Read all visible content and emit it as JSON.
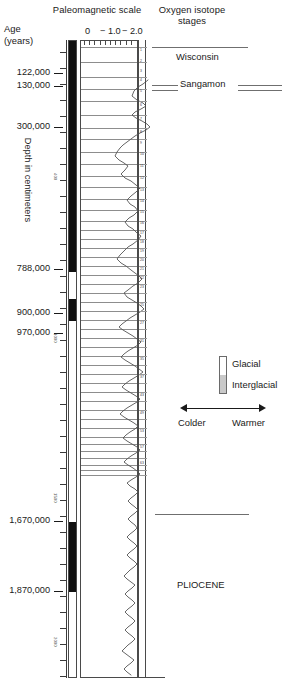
{
  "figure": {
    "type": "stratigraphic-column",
    "paleomagnetic_title": "Paleomagnetic scale",
    "oxygen_title": "Oxygen isotope stages",
    "age_axis_label_line1": "Age",
    "age_axis_label_line2": "(years)",
    "depth_axis_label": "Depth in centimeters"
  },
  "scale": {
    "ticks": [
      "0",
      "− 1.0",
      "− 2.0"
    ],
    "tick_x": [
      8,
      28,
      48
    ],
    "tick_label_x": [
      5,
      20,
      42
    ]
  },
  "age_labels": [
    {
      "text": "122,000",
      "y": 73
    },
    {
      "text": "130,000",
      "y": 86
    },
    {
      "text": "300,000",
      "y": 127
    },
    {
      "text": "788,000",
      "y": 269
    },
    {
      "text": "900,000",
      "y": 313
    },
    {
      "text": "970,000",
      "y": 333
    },
    {
      "text": "1,670,000",
      "y": 521
    },
    {
      "text": "1,870,000",
      "y": 591
    }
  ],
  "depth_ticks": [
    {
      "y": 52,
      "num": ""
    },
    {
      "y": 68,
      "num": ""
    },
    {
      "y": 84,
      "num": ""
    },
    {
      "y": 100,
      "num": ""
    },
    {
      "y": 116,
      "num": ""
    },
    {
      "y": 132,
      "num": ""
    },
    {
      "y": 148,
      "num": ""
    },
    {
      "y": 164,
      "num": ""
    },
    {
      "y": 180,
      "num": "400"
    },
    {
      "y": 196,
      "num": ""
    },
    {
      "y": 212,
      "num": ""
    },
    {
      "y": 228,
      "num": ""
    },
    {
      "y": 244,
      "num": ""
    },
    {
      "y": 260,
      "num": ""
    },
    {
      "y": 276,
      "num": ""
    },
    {
      "y": 292,
      "num": ""
    },
    {
      "y": 308,
      "num": ""
    },
    {
      "y": 324,
      "num": ""
    },
    {
      "y": 340,
      "num": "1000"
    },
    {
      "y": 356,
      "num": ""
    },
    {
      "y": 372,
      "num": ""
    },
    {
      "y": 388,
      "num": ""
    },
    {
      "y": 404,
      "num": ""
    },
    {
      "y": 420,
      "num": ""
    },
    {
      "y": 436,
      "num": ""
    },
    {
      "y": 452,
      "num": ""
    },
    {
      "y": 468,
      "num": ""
    },
    {
      "y": 484,
      "num": ""
    },
    {
      "y": 500,
      "num": "1500"
    },
    {
      "y": 516,
      "num": ""
    },
    {
      "y": 532,
      "num": ""
    },
    {
      "y": 548,
      "num": ""
    },
    {
      "y": 564,
      "num": ""
    },
    {
      "y": 580,
      "num": ""
    },
    {
      "y": 596,
      "num": ""
    },
    {
      "y": 612,
      "num": ""
    },
    {
      "y": 628,
      "num": ""
    },
    {
      "y": 644,
      "num": "2000"
    },
    {
      "y": 660,
      "num": ""
    },
    {
      "y": 676,
      "num": ""
    }
  ],
  "paleomagnetic_bands": [
    {
      "name": "brunhes-normal",
      "top": 0,
      "height": 231,
      "polarity": "normal"
    },
    {
      "name": "jaramillo-normal",
      "top": 258,
      "height": 22,
      "polarity": "normal"
    },
    {
      "name": "olduvai-normal",
      "top": 481,
      "height": 70,
      "polarity": "normal"
    }
  ],
  "stage_boundaries_y": [
    7,
    22,
    37,
    49,
    61,
    75,
    88,
    99,
    112,
    124,
    136,
    147,
    159,
    170,
    181,
    190,
    199,
    208,
    217,
    226,
    235,
    244,
    253,
    262,
    271,
    280,
    289,
    298,
    307,
    316,
    325,
    334,
    343,
    352,
    361,
    370,
    379,
    388,
    397,
    404,
    411,
    418,
    425,
    430,
    435
  ],
  "stage_numbers": [
    {
      "label": "1",
      "y": 9
    },
    {
      "label": "2",
      "y": 20
    },
    {
      "label": "3",
      "y": 30
    },
    {
      "label": "4",
      "y": 39
    },
    {
      "label": "5",
      "y": 50
    },
    {
      "label": "6",
      "y": 64
    },
    {
      "label": "7",
      "y": 78
    },
    {
      "label": "8",
      "y": 91
    },
    {
      "label": "9",
      "y": 102
    },
    {
      "label": "10",
      "y": 113
    },
    {
      "label": "11",
      "y": 125
    },
    {
      "label": "12",
      "y": 137
    },
    {
      "label": "13",
      "y": 149
    },
    {
      "label": "14",
      "y": 160
    },
    {
      "label": "15",
      "y": 171
    },
    {
      "label": "16",
      "y": 182
    },
    {
      "label": "17",
      "y": 192
    },
    {
      "label": "18",
      "y": 201
    },
    {
      "label": "19",
      "y": 210
    },
    {
      "label": "20",
      "y": 219
    },
    {
      "label": "21",
      "y": 228
    },
    {
      "label": "22",
      "y": 237
    },
    {
      "label": "23",
      "y": 246
    },
    {
      "label": "25",
      "y": 264
    },
    {
      "label": "27",
      "y": 282
    },
    {
      "label": "31",
      "y": 300
    },
    {
      "label": "35",
      "y": 318
    },
    {
      "label": "37",
      "y": 336
    },
    {
      "label": "43",
      "y": 354
    },
    {
      "label": "49",
      "y": 372
    },
    {
      "label": "53",
      "y": 390
    },
    {
      "label": "57",
      "y": 406
    },
    {
      "label": "63",
      "y": 422
    }
  ],
  "annotations": [
    {
      "name": "wisconsin",
      "label": "Wisconsin",
      "x": 176,
      "y": 57
    },
    {
      "name": "sangamon",
      "label": "Sangamon",
      "x": 180,
      "y": 84
    },
    {
      "name": "pliocene",
      "label": "PLIOCENE",
      "x": 177,
      "y": 585
    }
  ],
  "annotation_lines": [
    {
      "name": "wisconsin-top-rule",
      "x": 152,
      "y": 47,
      "width": 96
    },
    {
      "name": "sangamon-left-rule-a",
      "x": 152,
      "y": 85,
      "width": 26
    },
    {
      "name": "sangamon-left-rule-b",
      "x": 152,
      "y": 90,
      "width": 26
    },
    {
      "name": "sangamon-right-rule-a",
      "x": 238,
      "y": 85,
      "width": 44
    },
    {
      "name": "sangamon-right-rule-b",
      "x": 238,
      "y": 90,
      "width": 44
    },
    {
      "name": "pliocene-boundary-rule",
      "x": 155,
      "y": 514,
      "width": 94
    }
  ],
  "legend": {
    "glacial_label": "Glacial",
    "interglacial_label": "Interglacial",
    "glacial_color": "#ffffff",
    "interglacial_color": "#c9c9c9",
    "colder_label": "Colder",
    "warmer_label": "Warmer"
  },
  "chart_data": {
    "type": "line",
    "title": "Oxygen isotope stages",
    "xlabel": "delta O-18 (per mil)",
    "ylabel": "Depth in centimeters",
    "xlim": [
      0,
      -2.0
    ],
    "xticks": [
      0,
      -1.0,
      -2.0
    ],
    "grid": true,
    "orientation": "vertical-depth",
    "series_name": "delta-O18-curve",
    "curve_points": "68,40 63,44 58,47 54,51 52,56 57,60 63,63 66,66 61,69 55,72 52,75 56,78 62,81 67,84 70,87 66,90 60,93 55,96 51,99 47,102 43,105 40,108 37,112 35,116 39,120 44,123 48,126 45,130 41,134 45,138 51,141 56,145 60,148 56,152 51,156 47,160 50,164 55,167 58,171 54,175 49,178 45,182 48,186 53,189 57,193 61,196 58,200 53,204 48,207 44,211 40,215 37,219 41,223 46,226 51,230 55,233 59,236 62,239 58,243 53,246 48,250 44,253 47,257 52,260 57,263 61,266 64,269 60,272 55,275 50,278 46,281 42,284 39,287 43,290 48,293 53,296 57,299 61,302 58,305 53,308 48,311 44,314 41,317 45,320 50,323 55,326 59,329 63,332 59,335 54,338 49,341 45,344 42,347 46,350 51,353 56,356 60,359 57,362 52,365 47,368 43,371 40,374 44,377 49,380 54,383 58,386 55,389 50,392 46,395 43,398 47,401 52,404 57,407 60,410 56,413 51,416 47,419 44,422 48,425 53,428 57,431 60,434 56,437 51,440 47,443 50,446 55,449 58,452 55,455 51,458 48,461 51,464 55,467 58,470 55,473 51,476 48,479 51,482 55,485 57,488 54,491 50,494 47,497 50,500 54,503 57,506 54,509 50,512 47,515 50,518 54,521 57,524 54,527 50,530 47,533 44,536 47,539 51,542 55,545 52,548 48,551 45,554 48,557 52,560 55,563 52,566 48,569 45,572 48,575 52,578 55,581 52,584 48,587 45,590 48,593 52,596 55,599 52,602 48,605 45,608 42,611 46,614 50,617 54,620 51,623 47,626 44,629 47,632 51,635"
  }
}
